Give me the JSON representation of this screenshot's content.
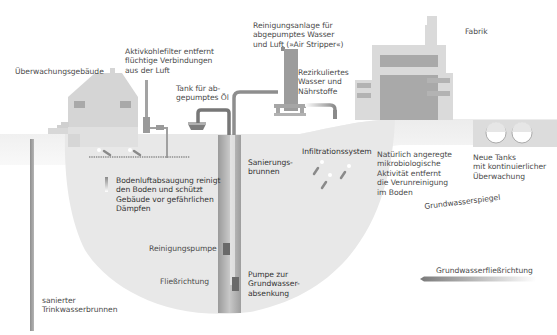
{
  "diagram": {
    "colors": {
      "background": "#ffffff",
      "ground_surface": "#eeeeee",
      "subsurface_zone": "#e6e6e6",
      "building_light": "#d9d9d9",
      "building_dark": "#a8a8a8",
      "pipe": "#8a8a8a",
      "pump": "#6e6e6e",
      "text": "#4a4a4a"
    },
    "labels": {
      "monitoring_building": "Überwachungsgebäude",
      "activated_carbon_filter": "Aktivkohlefilter entfernt\nflüchtige Verbindungen\naus der Luft",
      "oil_tank": "Tank für ab-\ngepumptes Öl",
      "air_stripper": "Reinigungsanlage für\nabgepumptes Wasser\nund Luft (»Air Stripper«)",
      "recirculated_water": "Rezirkuliertes\nWasser und\nNährstoffe",
      "factory": "Fabrik",
      "remediation_well": "Sanierungs-\nbrunnen",
      "infiltration_system": "Infiltrationssystem",
      "microbial_activity": "Natürlich angeregte\nmikrobiologische\nAktivität entfernt\ndie Verunreinigung\nim Boden",
      "new_tanks": "Neue Tanks\nmit kontinuierlicher\nÜberwachung",
      "soil_vapor_extraction": "Bodenluftabsaugung reinigt\nden Boden und schützt\nGebäude vor gefährlichen\nDämpfen",
      "groundwater_table": "Grundwasserspiegel",
      "cleaning_pump": "Reinigungspumpe",
      "flow_direction": "Fließrichtung",
      "dewatering_pump": "Pumpe zur\nGrundwasser-\nabsenkung",
      "groundwater_flow_direction": "Grundwasserfließrichtung",
      "remediated_drinking_well": "sanierter\nTrinkwasserbrunnen"
    }
  }
}
